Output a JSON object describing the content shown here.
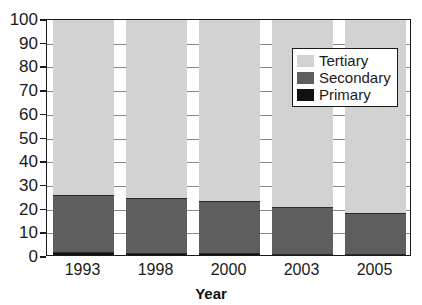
{
  "chart_data": {
    "type": "bar",
    "subtype": "stacked-percentage",
    "title": "",
    "xlabel": "Year",
    "ylabel": "",
    "categories": [
      "1993",
      "1998",
      "2000",
      "2003",
      "2005"
    ],
    "series": [
      {
        "name": "Primary",
        "color": "#111111",
        "values": [
          2.0,
          1.8,
          1.5,
          1.2,
          1.2
        ]
      },
      {
        "name": "Secondary",
        "color": "#5e5e5e",
        "values": [
          24.0,
          23.2,
          22.0,
          19.8,
          17.3
        ]
      },
      {
        "name": "Tertiary",
        "color": "#d2d2d2",
        "values": [
          74.0,
          75.0,
          76.5,
          79.0,
          81.5
        ]
      }
    ],
    "cumulative_tops": {
      "primary": [
        2.0,
        1.8,
        1.5,
        1.2,
        1.2
      ],
      "secondary": [
        26.0,
        25.0,
        23.5,
        21.0,
        18.5
      ],
      "tertiary": [
        100,
        100,
        100,
        100,
        100
      ]
    },
    "ylim": [
      0,
      100
    ],
    "y_ticks": [
      0,
      10,
      20,
      30,
      40,
      50,
      60,
      70,
      80,
      90,
      100
    ],
    "y_tick_labels": [
      "0",
      "10",
      "20",
      "30",
      "40",
      "50",
      "60",
      "70",
      "80",
      "90",
      "100"
    ],
    "grid": true,
    "legend_position": "upper-right-inside",
    "legend_entries": [
      "Tertiary",
      "Secondary",
      "Primary"
    ]
  }
}
